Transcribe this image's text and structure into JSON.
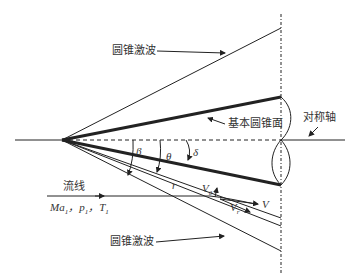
{
  "diagram": {
    "labels": {
      "shock_top": "圆锥激波",
      "shock_bottom": "圆锥激波",
      "cone_surface": "基本圆锥面",
      "symmetry_axis": "对称轴",
      "streamline": "流线",
      "freestream_ma": "Ma",
      "freestream_p": "p",
      "freestream_t": "T",
      "freestream_sub": "1",
      "freestream_sep": "，",
      "beta": "β",
      "theta": "θ",
      "delta": "δ",
      "r": "r",
      "v_theta": "V",
      "v_theta_sub": "θ",
      "v_r": "V",
      "v_r_sub": "r",
      "v": "V"
    },
    "colors": {
      "line": "#222222",
      "text": "#333333"
    }
  }
}
